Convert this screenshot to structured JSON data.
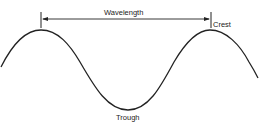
{
  "diagram": {
    "labels": {
      "wavelength": "Wavelength",
      "crest": "Crest",
      "trough": "Trough"
    },
    "colors": {
      "line": "#222222",
      "background": "#ffffff"
    }
  }
}
